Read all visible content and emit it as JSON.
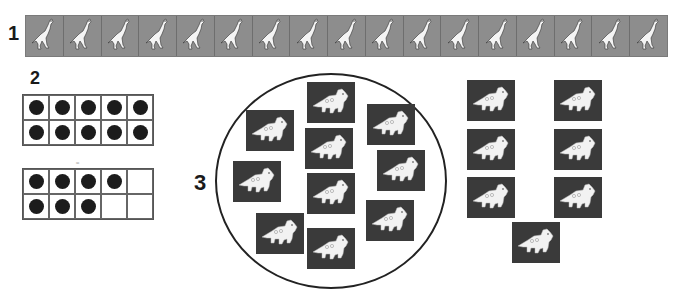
{
  "section1": {
    "label": "1",
    "tile_count": 17,
    "tile_icon": "running-dinosaur-icon",
    "tile_color": "#8d8d8d"
  },
  "section2": {
    "label": "2",
    "frames": [
      {
        "name": "ten-frame-full",
        "filled": [
          1,
          1,
          1,
          1,
          1,
          1,
          1,
          1,
          1,
          1
        ]
      },
      {
        "name": "ten-frame-seven",
        "filled": [
          1,
          1,
          1,
          1,
          0,
          1,
          1,
          1,
          0,
          0
        ]
      }
    ],
    "mark": "≈"
  },
  "section3": {
    "label": "3",
    "circle_group": {
      "count": 10,
      "tile_icon": "triceratops-icon",
      "tile_color": "#3a3a3a",
      "positions": [
        {
          "x": 246,
          "y": 110
        },
        {
          "x": 307,
          "y": 82
        },
        {
          "x": 367,
          "y": 104
        },
        {
          "x": 305,
          "y": 128
        },
        {
          "x": 377,
          "y": 150
        },
        {
          "x": 233,
          "y": 161
        },
        {
          "x": 307,
          "y": 173
        },
        {
          "x": 366,
          "y": 200
        },
        {
          "x": 256,
          "y": 213
        },
        {
          "x": 307,
          "y": 228
        }
      ]
    },
    "side_group": {
      "count": 7,
      "tile_icon": "triceratops-icon",
      "positions": [
        {
          "x": 467,
          "y": 80
        },
        {
          "x": 554,
          "y": 80
        },
        {
          "x": 467,
          "y": 129
        },
        {
          "x": 554,
          "y": 129
        },
        {
          "x": 467,
          "y": 177
        },
        {
          "x": 554,
          "y": 177
        },
        {
          "x": 512,
          "y": 222
        }
      ]
    }
  }
}
